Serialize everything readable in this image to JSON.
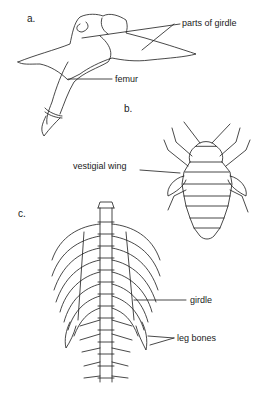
{
  "figure": {
    "panels": [
      {
        "id": "a",
        "label": "a.",
        "subject": "pelvic girdle and femur",
        "annotations": [
          "parts of girdle",
          "femur"
        ]
      },
      {
        "id": "b",
        "label": "b.",
        "subject": "insect with vestigial wings",
        "annotations": [
          "vestigial wing"
        ]
      },
      {
        "id": "c",
        "label": "c.",
        "subject": "skeleton with vestigial leg bones",
        "annotations": [
          "girdle",
          "leg bones"
        ]
      }
    ]
  },
  "colors": {
    "ink": "#1a1a1a",
    "background": "#ffffff"
  }
}
